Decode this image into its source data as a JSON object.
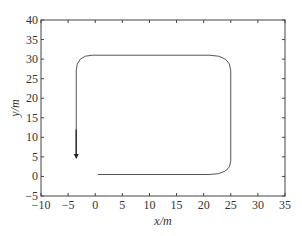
{
  "chart_data": {
    "type": "line",
    "title": "",
    "xlabel": "x/m",
    "ylabel": "y/m",
    "xlim": [
      -10,
      35
    ],
    "ylim": [
      -5,
      40
    ],
    "xticks": [
      -10,
      -5,
      0,
      5,
      10,
      15,
      20,
      25,
      30,
      35
    ],
    "yticks": [
      -5,
      0,
      5,
      10,
      15,
      20,
      25,
      30,
      35,
      40
    ],
    "xtick_labels": [
      "−10",
      "−5",
      "0",
      "5",
      "10",
      "15",
      "20",
      "25",
      "30",
      "35"
    ],
    "ytick_labels": [
      "−5",
      "0",
      "5",
      "10",
      "15",
      "20",
      "25",
      "30",
      "35",
      "40"
    ],
    "grid": false,
    "legend": null,
    "series": [
      {
        "name": "trajectory",
        "color": "#555555",
        "points": [
          [
            0.5,
            0.5
          ],
          [
            21,
            0.5
          ],
          [
            23.5,
            1.5
          ],
          [
            25,
            4
          ],
          [
            25,
            27
          ],
          [
            23.5,
            30
          ],
          [
            21,
            31
          ],
          [
            -0.5,
            31
          ],
          [
            -2.5,
            30
          ],
          [
            -3.5,
            27
          ],
          [
            -3.5,
            5
          ]
        ],
        "end_marker": "arrow"
      }
    ]
  }
}
